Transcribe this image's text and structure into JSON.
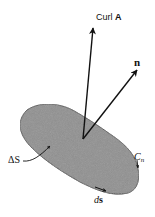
{
  "diagram": {
    "labels": {
      "curl": "Curl ",
      "curl_symbol": "A",
      "normal": "n",
      "area": "ΔS",
      "contour": "C",
      "contour_sub": "n",
      "line_element_d": "d",
      "line_element_s": "s"
    },
    "colors": {
      "stroke": "#111111",
      "fill": "#8a8a8a",
      "background": "#ffffff"
    }
  }
}
